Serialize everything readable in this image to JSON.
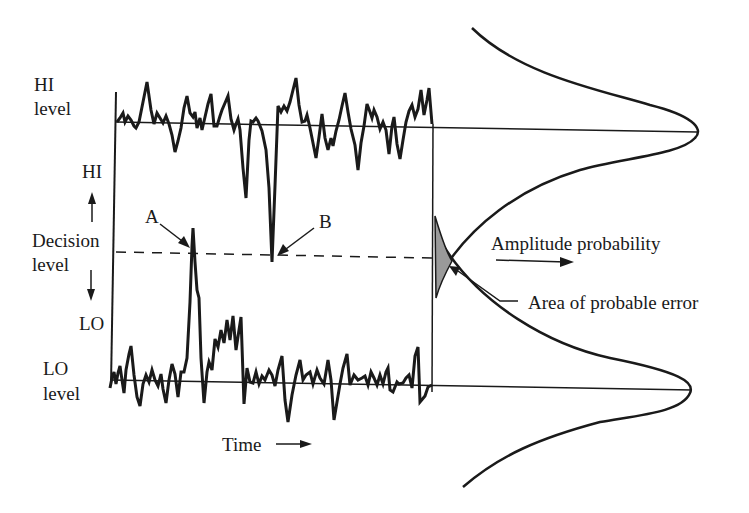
{
  "figure": {
    "labels": {
      "hi_level_1": "HI",
      "hi_level_2": "level",
      "hi": "HI",
      "decision_1": "Decision",
      "decision_2": "level",
      "lo": "LO",
      "lo_level_1": "LO",
      "lo_level_2": "level",
      "point_a": "A",
      "point_b": "B",
      "time": "Time",
      "amplitude_probability": "Amplitude probability",
      "area_of_probable_error": "Area of probable error"
    },
    "colors": {
      "ink": "#1a1a1a",
      "error_fill": "#9a9a9a",
      "background": "#ffffff"
    }
  },
  "diagram": {
    "type": "signal-noise-decision-diagram",
    "levels": [
      "HI level",
      "Decision level",
      "LO level"
    ],
    "annotations": [
      {
        "label": "A",
        "meaning": "LO signal noise spike crossing decision level upward"
      },
      {
        "label": "B",
        "meaning": "HI signal noise spike crossing decision level downward"
      },
      {
        "label": "Area of probable error",
        "meaning": "overlap of the two amplitude probability curves near decision level"
      }
    ],
    "axis": {
      "x": "Time",
      "curves_direction": "Amplitude probability"
    }
  }
}
